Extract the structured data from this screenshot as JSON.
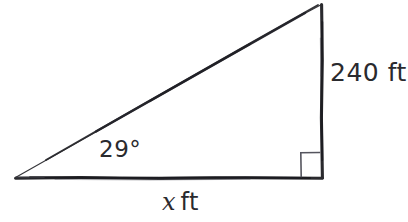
{
  "figure": {
    "type": "right-triangle-diagram",
    "background_color": "#ffffff",
    "ink_color": "#2a2a2e",
    "style": "hand-drawn",
    "geometry": {
      "left_vertex": [
        15,
        178
      ],
      "right_angle_vertex": [
        322,
        178
      ],
      "apex_vertex": [
        322,
        4
      ],
      "right_angle_marker_size": 19
    },
    "labels": {
      "vertical_side": "240 ft",
      "vertical_value": "240",
      "vertical_unit": "ft",
      "angle": "29°",
      "angle_value": "29",
      "base_variable": "x",
      "base_unit": "ft",
      "base_side": "x ft"
    },
    "marker": {
      "right_angle_name": "right-angle-square",
      "right_angle_symbol": "∟"
    }
  }
}
